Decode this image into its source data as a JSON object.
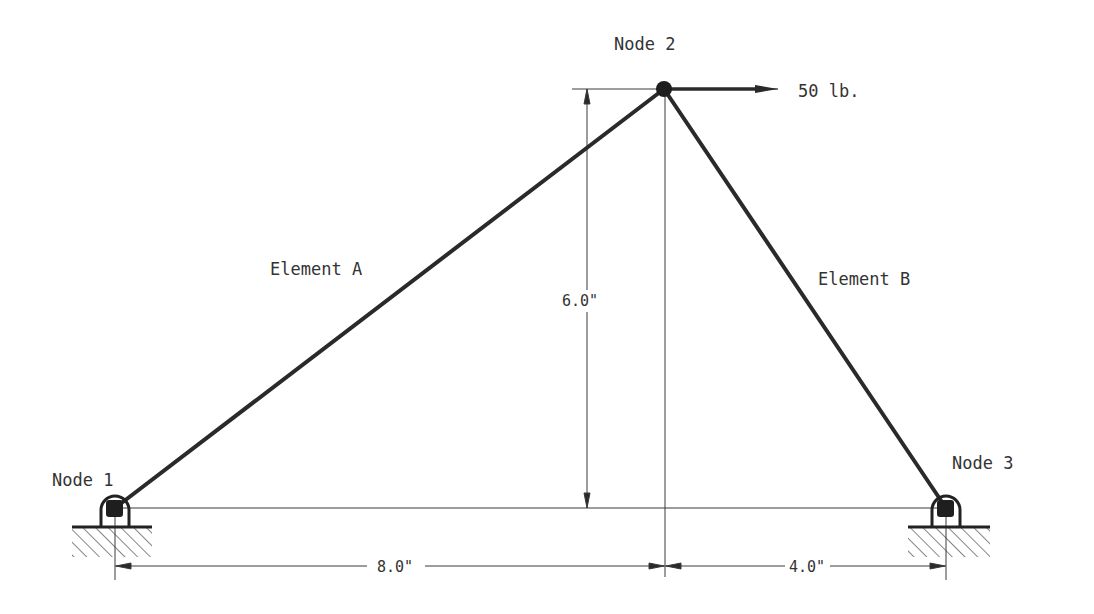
{
  "diagram": {
    "type": "truss",
    "colors": {
      "member": "#2a2a2a",
      "dimension": "#3a3a3a",
      "text": "#333333",
      "background": "#ffffff"
    },
    "nodes": [
      {
        "id": "node-1",
        "label": "Node 1",
        "x": 115,
        "y": 508,
        "support": "pin"
      },
      {
        "id": "node-2",
        "label": "Node 2",
        "x": 664,
        "y": 89,
        "support": "none"
      },
      {
        "id": "node-3",
        "label": "Node 3",
        "x": 946,
        "y": 508,
        "support": "pin"
      }
    ],
    "elements": [
      {
        "id": "element-a",
        "label": "Element A",
        "from": "node-1",
        "to": "node-2"
      },
      {
        "id": "element-b",
        "label": "Element B",
        "from": "node-2",
        "to": "node-3"
      }
    ],
    "load": {
      "node": "node-2",
      "label": "50 lb.",
      "direction": "right",
      "magnitude": 50,
      "unit": "lb."
    },
    "dimensions": {
      "height": {
        "label": "6.0\"",
        "value": 6.0
      },
      "left_span": {
        "label": "8.0\"",
        "value": 8.0
      },
      "right_span": {
        "label": "4.0\"",
        "value": 4.0
      }
    }
  }
}
